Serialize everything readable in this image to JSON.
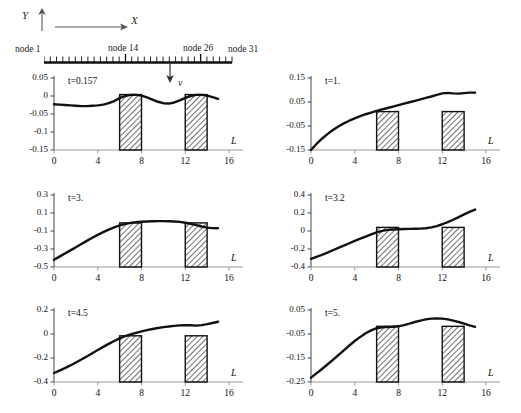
{
  "figure": {
    "axes_legend": {
      "y_label": "Y",
      "x_label": "X",
      "y_arrow_icon": "arrow-up-icon",
      "x_arrow_icon": "arrow-right-icon"
    },
    "node_ruler": {
      "labels": [
        "node 1",
        "node 14",
        "node 26",
        "node 31"
      ],
      "total_ticks": 30,
      "major_tick_nodes": [
        14,
        26
      ],
      "load_arrow_label": "v",
      "load_arrow_icon": "arrow-down-icon",
      "load_position_L": 10
    }
  },
  "chart_data": [
    {
      "type": "line",
      "title": "t=0.157",
      "xlabel": "L",
      "ylabel": "",
      "xlim": [
        0,
        16
      ],
      "ylim": [
        -0.15,
        0.05
      ],
      "xticks": [
        0,
        4,
        8,
        12,
        16
      ],
      "yticks": [
        0.05,
        0,
        -0.05,
        -0.1,
        -0.15
      ],
      "grid": false,
      "x": [
        0,
        0.5,
        1,
        1.5,
        2,
        2.5,
        3,
        3.5,
        4,
        4.5,
        5,
        5.5,
        6,
        6.5,
        7,
        7.5,
        8,
        8.5,
        9,
        9.5,
        10,
        10.5,
        11,
        11.5,
        12,
        12.5,
        13,
        13.5,
        14,
        14.5,
        15
      ],
      "values": [
        -0.023,
        -0.024,
        -0.025,
        -0.026,
        -0.027,
        -0.028,
        -0.028,
        -0.027,
        -0.026,
        -0.024,
        -0.02,
        -0.014,
        -0.006,
        0.0,
        0.003,
        0.003,
        0.001,
        -0.004,
        -0.01,
        -0.016,
        -0.02,
        -0.021,
        -0.018,
        -0.012,
        -0.005,
        0.0,
        0.003,
        0.003,
        0.001,
        -0.003,
        -0.008
      ],
      "bars": [
        {
          "x_start": 6,
          "x_end": 8,
          "top_value": 0.004,
          "hatch": "diagonal"
        },
        {
          "x_start": 12,
          "x_end": 14,
          "top_value": 0.004,
          "hatch": "diagonal"
        }
      ]
    },
    {
      "type": "line",
      "title": "t=1.",
      "xlabel": "L",
      "ylabel": "",
      "xlim": [
        0,
        16
      ],
      "ylim": [
        -0.15,
        0.15
      ],
      "xticks": [
        0,
        4,
        8,
        12,
        16
      ],
      "yticks": [
        0.15,
        0.05,
        -0.05,
        -0.15
      ],
      "grid": false,
      "x": [
        0,
        0.5,
        1,
        1.5,
        2,
        2.5,
        3,
        3.5,
        4,
        4.5,
        5,
        5.5,
        6,
        6.5,
        7,
        7.5,
        8,
        8.5,
        9,
        9.5,
        10,
        10.5,
        11,
        11.5,
        12,
        12.5,
        13,
        13.5,
        14,
        14.5,
        15
      ],
      "values": [
        -0.15,
        -0.125,
        -0.103,
        -0.084,
        -0.067,
        -0.052,
        -0.039,
        -0.028,
        -0.018,
        -0.009,
        -0.001,
        0.006,
        0.013,
        0.019,
        0.025,
        0.031,
        0.037,
        0.043,
        0.049,
        0.055,
        0.061,
        0.067,
        0.073,
        0.08,
        0.086,
        0.088,
        0.086,
        0.085,
        0.087,
        0.089,
        0.089
      ],
      "bars": [
        {
          "x_start": 6,
          "x_end": 8,
          "top_value": 0.01,
          "hatch": "diagonal"
        },
        {
          "x_start": 12,
          "x_end": 14,
          "top_value": 0.01,
          "hatch": "diagonal"
        }
      ]
    },
    {
      "type": "line",
      "title": "t=3.",
      "xlabel": "L",
      "ylabel": "",
      "xlim": [
        0,
        16
      ],
      "ylim": [
        -0.5,
        0.3
      ],
      "xticks": [
        0,
        4,
        8,
        12,
        16
      ],
      "yticks": [
        0.3,
        0.1,
        -0.1,
        -0.3,
        -0.5
      ],
      "grid": false,
      "x": [
        0,
        0.5,
        1,
        1.5,
        2,
        2.5,
        3,
        3.5,
        4,
        4.5,
        5,
        5.5,
        6,
        6.5,
        7,
        7.5,
        8,
        8.5,
        9,
        9.5,
        10,
        10.5,
        11,
        11.5,
        12,
        12.5,
        13,
        13.5,
        14,
        14.5,
        15
      ],
      "values": [
        -0.42,
        -0.385,
        -0.35,
        -0.315,
        -0.28,
        -0.245,
        -0.21,
        -0.175,
        -0.143,
        -0.113,
        -0.085,
        -0.06,
        -0.038,
        -0.022,
        -0.01,
        -0.002,
        0.003,
        0.006,
        0.008,
        0.01,
        0.01,
        0.009,
        0.006,
        0.001,
        -0.008,
        -0.02,
        -0.035,
        -0.05,
        -0.062,
        -0.068,
        -0.07
      ],
      "bars": [
        {
          "x_start": 6,
          "x_end": 8,
          "top_value": -0.01,
          "hatch": "diagonal"
        },
        {
          "x_start": 12,
          "x_end": 14,
          "top_value": -0.01,
          "hatch": "diagonal"
        }
      ]
    },
    {
      "type": "line",
      "title": "t=3.2",
      "xlabel": "L",
      "ylabel": "",
      "xlim": [
        0,
        16
      ],
      "ylim": [
        -0.4,
        0.4
      ],
      "xticks": [
        0,
        4,
        8,
        12,
        16
      ],
      "yticks": [
        0.4,
        0.2,
        0,
        -0.2,
        -0.4
      ],
      "grid": false,
      "x": [
        0,
        0.5,
        1,
        1.5,
        2,
        2.5,
        3,
        3.5,
        4,
        4.5,
        5,
        5.5,
        6,
        6.5,
        7,
        7.5,
        8,
        8.5,
        9,
        9.5,
        10,
        10.5,
        11,
        11.5,
        12,
        12.5,
        13,
        13.5,
        14,
        14.5,
        15
      ],
      "values": [
        -0.31,
        -0.288,
        -0.265,
        -0.24,
        -0.214,
        -0.188,
        -0.162,
        -0.136,
        -0.11,
        -0.086,
        -0.062,
        -0.038,
        -0.015,
        0.002,
        0.012,
        0.017,
        0.02,
        0.022,
        0.024,
        0.025,
        0.026,
        0.03,
        0.04,
        0.055,
        0.075,
        0.098,
        0.125,
        0.155,
        0.185,
        0.212,
        0.238
      ],
      "bars": [
        {
          "x_start": 6,
          "x_end": 8,
          "top_value": 0.04,
          "hatch": "diagonal"
        },
        {
          "x_start": 12,
          "x_end": 14,
          "top_value": 0.04,
          "hatch": "diagonal"
        }
      ]
    },
    {
      "type": "line",
      "title": "t=4.5",
      "xlabel": "L",
      "ylabel": "",
      "xlim": [
        0,
        16
      ],
      "ylim": [
        -0.4,
        0.2
      ],
      "xticks": [
        0,
        4,
        8,
        12,
        16
      ],
      "yticks": [
        0.2,
        0,
        -0.2,
        -0.4
      ],
      "grid": false,
      "x": [
        0,
        0.5,
        1,
        1.5,
        2,
        2.5,
        3,
        3.5,
        4,
        4.5,
        5,
        5.5,
        6,
        6.5,
        7,
        7.5,
        8,
        8.5,
        9,
        9.5,
        10,
        10.5,
        11,
        11.5,
        12,
        12.5,
        13,
        13.5,
        14,
        14.5,
        15
      ],
      "values": [
        -0.325,
        -0.305,
        -0.284,
        -0.262,
        -0.238,
        -0.213,
        -0.187,
        -0.16,
        -0.133,
        -0.107,
        -0.082,
        -0.058,
        -0.036,
        -0.018,
        -0.003,
        0.01,
        0.022,
        0.032,
        0.042,
        0.05,
        0.057,
        0.063,
        0.068,
        0.072,
        0.074,
        0.073,
        0.07,
        0.074,
        0.082,
        0.092,
        0.102
      ],
      "bars": [
        {
          "x_start": 6,
          "x_end": 8,
          "top_value": -0.015,
          "hatch": "diagonal"
        },
        {
          "x_start": 12,
          "x_end": 14,
          "top_value": -0.015,
          "hatch": "diagonal"
        }
      ]
    },
    {
      "type": "line",
      "title": "t=5.",
      "xlabel": "L",
      "ylabel": "",
      "xlim": [
        0,
        16
      ],
      "ylim": [
        -0.25,
        0.05
      ],
      "xticks": [
        0,
        4,
        8,
        12,
        16
      ],
      "yticks": [
        0.05,
        -0.05,
        -0.15,
        -0.25
      ],
      "grid": false,
      "x": [
        0,
        0.5,
        1,
        1.5,
        2,
        2.5,
        3,
        3.5,
        4,
        4.5,
        5,
        5.5,
        6,
        6.5,
        7,
        7.5,
        8,
        8.5,
        9,
        9.5,
        10,
        10.5,
        11,
        11.5,
        12,
        12.5,
        13,
        13.5,
        14,
        14.5,
        15
      ],
      "values": [
        -0.232,
        -0.214,
        -0.196,
        -0.177,
        -0.158,
        -0.138,
        -0.118,
        -0.098,
        -0.079,
        -0.062,
        -0.047,
        -0.035,
        -0.026,
        -0.022,
        -0.021,
        -0.02,
        -0.018,
        -0.013,
        -0.007,
        0.0,
        0.006,
        0.011,
        0.014,
        0.015,
        0.014,
        0.011,
        0.006,
        0.0,
        -0.007,
        -0.014,
        -0.02
      ],
      "bars": [
        {
          "x_start": 6,
          "x_end": 8,
          "top_value": -0.018,
          "hatch": "diagonal"
        },
        {
          "x_start": 12,
          "x_end": 14,
          "top_value": -0.018,
          "hatch": "diagonal"
        }
      ]
    }
  ]
}
